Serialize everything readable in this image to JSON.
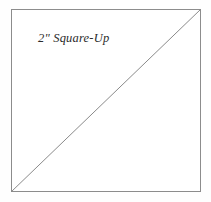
{
  "diagram": {
    "title_label": "2\" Square-Up",
    "shape_name": "square",
    "background_color": "#ffffff",
    "outline_color": "#8c8c8c",
    "diagonal_color": "#8a8a8a",
    "label_color": "#2b2b2b",
    "square": {
      "left": 11,
      "top": 9,
      "width": 190,
      "height": 183
    },
    "diagonal": {
      "from": "bottom-left",
      "to": "top-right",
      "x1": 0,
      "y1": 183,
      "x2": 190,
      "y2": 0
    }
  }
}
